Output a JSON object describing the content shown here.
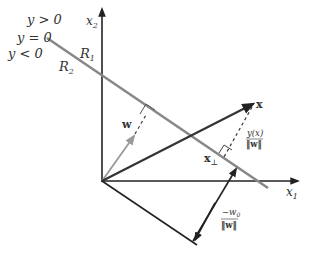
{
  "diagram": {
    "colors": {
      "axis": "#222222",
      "decision_boundary": "#888888",
      "w_vector": "#999999",
      "x_vector": "#333333",
      "label": "#333333"
    },
    "labels": {
      "x1_axis": "x",
      "x1_sub": "1",
      "x2_axis": "x",
      "x2_sub": "2",
      "y_gt": "y > 0",
      "y_eq": "y = 0",
      "y_lt": "y < 0",
      "region1": "R",
      "region1_sub": "1",
      "region2": "R",
      "region2_sub": "2",
      "w": "w",
      "x": "x",
      "x_perp": "x",
      "x_perp_sub": "⊥",
      "dist_num": "y(x)",
      "dist_den": "‖w‖",
      "bias_num": "−w",
      "bias_num_sub": "0",
      "bias_den": "‖w‖"
    }
  }
}
